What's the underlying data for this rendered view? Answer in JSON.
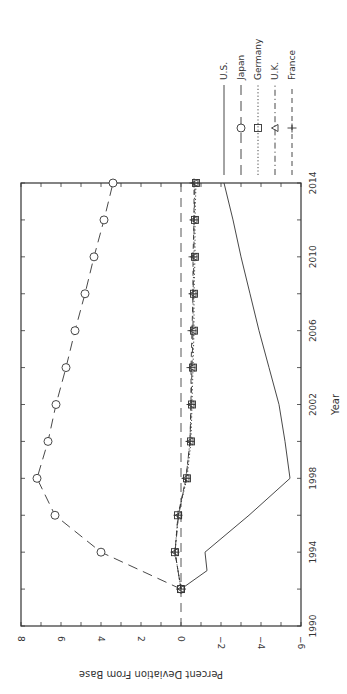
{
  "chart_data": {
    "type": "line",
    "orientation": "rotated-90-clockwise",
    "title": "",
    "xlabel": "Year",
    "ylabel": "Percent Deviation From Base",
    "xlim": [
      1990,
      2014
    ],
    "ylim": [
      -6,
      8
    ],
    "x_ticks": [
      1990,
      1994,
      1998,
      2002,
      2006,
      2010,
      2014
    ],
    "x_tick_labels": [
      "1990",
      "1994",
      "1998",
      "2002",
      "2006",
      "2010",
      "2014"
    ],
    "y_ticks": [
      8,
      6,
      4,
      2,
      0,
      -2,
      -4,
      -6
    ],
    "y_tick_labels": [
      "8",
      "6",
      "4",
      "2",
      "0",
      "−2",
      "−4",
      "−6"
    ],
    "grid": false,
    "legend_position": "right (top of rotated image)",
    "reference_line": {
      "value": 0,
      "style": "dashed"
    },
    "x": [
      1992,
      1993,
      1994,
      1996,
      1998,
      2000,
      2002,
      2004,
      2006,
      2008,
      2010,
      2012,
      2014
    ],
    "series": [
      {
        "name": "U.S.",
        "style": "solid",
        "marker": "none",
        "values": [
          0,
          -1.3,
          -1.2,
          -3.4,
          -5.45,
          -5.2,
          -4.9,
          -4.4,
          -3.9,
          -3.45,
          -3.0,
          -2.6,
          -2.15
        ]
      },
      {
        "name": "Japan",
        "style": "long-dash",
        "marker": "circle",
        "values": [
          0,
          2.0,
          4.0,
          6.3,
          7.2,
          6.65,
          6.25,
          5.75,
          5.3,
          4.8,
          4.35,
          3.85,
          3.4
        ]
      },
      {
        "name": "Germany",
        "style": "dotted",
        "marker": "square",
        "values": [
          0,
          0.15,
          0.3,
          0.15,
          -0.3,
          -0.5,
          -0.55,
          -0.6,
          -0.65,
          -0.65,
          -0.7,
          -0.7,
          -0.75
        ]
      },
      {
        "name": "U.K.",
        "style": "dash-dot",
        "marker": "triangle",
        "values": [
          0,
          0.15,
          0.3,
          0.12,
          -0.25,
          -0.45,
          -0.5,
          -0.55,
          -0.6,
          -0.6,
          -0.65,
          -0.65,
          -0.7
        ]
      },
      {
        "name": "France",
        "style": "dashed",
        "marker": "plus",
        "values": [
          0,
          0.15,
          0.3,
          0.15,
          -0.25,
          -0.45,
          -0.5,
          -0.5,
          -0.55,
          -0.6,
          -0.6,
          -0.65,
          -0.65
        ]
      }
    ]
  },
  "legend": [
    {
      "label": "U.S.",
      "style": "solid",
      "marker": "none"
    },
    {
      "label": "Japan",
      "style": "long-dash",
      "marker": "circle"
    },
    {
      "label": "Germany",
      "style": "dotted",
      "marker": "square"
    },
    {
      "label": "U.K.",
      "style": "dash-dot",
      "marker": "triangle"
    },
    {
      "label": "France",
      "style": "dashed",
      "marker": "plus"
    }
  ]
}
